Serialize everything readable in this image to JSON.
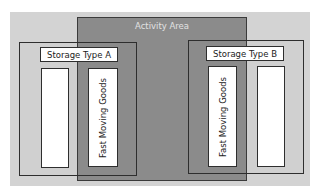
{
  "diagram": {
    "activity_area": {
      "label": "Activity Area",
      "color": "#8b8b8b"
    },
    "storage_types": [
      {
        "label": "Storage Type A",
        "bins": [
          {
            "label": ""
          },
          {
            "label": "Fast Moving Goods"
          }
        ]
      },
      {
        "label": "Storage Type B",
        "bins": [
          {
            "label": "Fast Moving Goods"
          },
          {
            "label": ""
          }
        ]
      }
    ],
    "colors": {
      "panel": "#d3d3d3",
      "border": "#2e2e2e",
      "bin": "#ffffff"
    }
  }
}
